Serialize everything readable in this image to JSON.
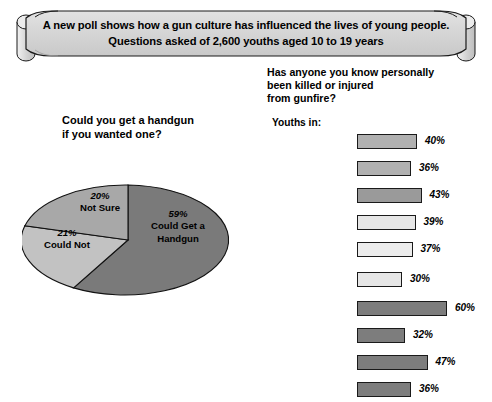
{
  "banner": {
    "line1": "A new poll shows how a gun culture has influenced the lives of young people.",
    "line2": "Questions asked of 2,600 youths aged 10 to 19 years",
    "fill": "#d4d4d4",
    "stroke": "#1a1a1a"
  },
  "pie_chart": {
    "title_line1": "Could you get a handgun",
    "title_line2": "if you wanted one?",
    "segments": [
      {
        "label": "Could Get a Handgun",
        "pct": "59%",
        "value": 59,
        "color": "#7a7a7a"
      },
      {
        "label": "Not Sure",
        "pct": "20%",
        "value": 20,
        "color": "#a8a8a8"
      },
      {
        "label": "Could Not",
        "pct": "21%",
        "value": 21,
        "color": "#c2c2c2"
      }
    ]
  },
  "bar_chart": {
    "title_line1": "Has anyone you know personally",
    "title_line2": "been killed or injured",
    "title_line3": "from gunfire?",
    "subtitle": "Youths in:",
    "rows": [
      {
        "label": "Central City",
        "pct": "40%",
        "value": 40,
        "color": "#b0b0b0"
      },
      {
        "label": "Suburbs",
        "pct": "36%",
        "value": 36,
        "color": "#b0b0b0"
      },
      {
        "label": "Small Towns/Rural",
        "pct": "43%",
        "value": 43,
        "color": "#9a9a9a"
      },
      {
        "label": "Public Schools",
        "pct": "39%",
        "value": 39,
        "color": "#e6e6e6"
      },
      {
        "label": "Private,\nnon-Catholic",
        "pct": "37%",
        "value": 37,
        "color": "#ececec"
      },
      {
        "label": "Catholic School",
        "pct": "30%",
        "value": 30,
        "color": "#e6e6e6"
      },
      {
        "label": "African American",
        "pct": "60%",
        "value": 60,
        "color": "#7d7d7d"
      },
      {
        "label": "Anglo-European American",
        "pct": "32%",
        "value": 32,
        "color": "#7d7d7d"
      },
      {
        "label": "Hispanic American or Latino",
        "pct": "47%",
        "value": 47,
        "color": "#7d7d7d"
      },
      {
        "label": "Asian American",
        "pct": "36%",
        "value": 36,
        "color": "#7d7d7d"
      }
    ]
  },
  "chart_data": [
    {
      "type": "pie",
      "title": "Could you get a handgun if you wanted one?",
      "categories": [
        "Could Get a Handgun",
        "Could Not",
        "Not Sure"
      ],
      "values": [
        59,
        21,
        20
      ],
      "unit": "%",
      "legend": "in-slice labels"
    },
    {
      "type": "bar",
      "title": "Has anyone you know personally been killed or injured from gunfire?",
      "subtitle": "Youths in:",
      "orientation": "horizontal",
      "categories": [
        "Central City",
        "Suburbs",
        "Small Towns/Rural",
        "Public Schools",
        "Private, non-Catholic",
        "Catholic School",
        "African American",
        "Anglo-European American",
        "Hispanic American or Latino",
        "Asian American"
      ],
      "values": [
        40,
        36,
        43,
        39,
        37,
        30,
        60,
        32,
        47,
        36
      ],
      "unit": "%",
      "xlabel": "",
      "ylabel": "",
      "xlim": [
        0,
        60
      ],
      "grid": false,
      "data_labels": [
        "40%",
        "36%",
        "43%",
        "39%",
        "37%",
        "30%",
        "60%",
        "32%",
        "47%",
        "36%"
      ]
    }
  ],
  "survey": {
    "sample_size": "2,600",
    "age_range": "10 to 19 years"
  }
}
